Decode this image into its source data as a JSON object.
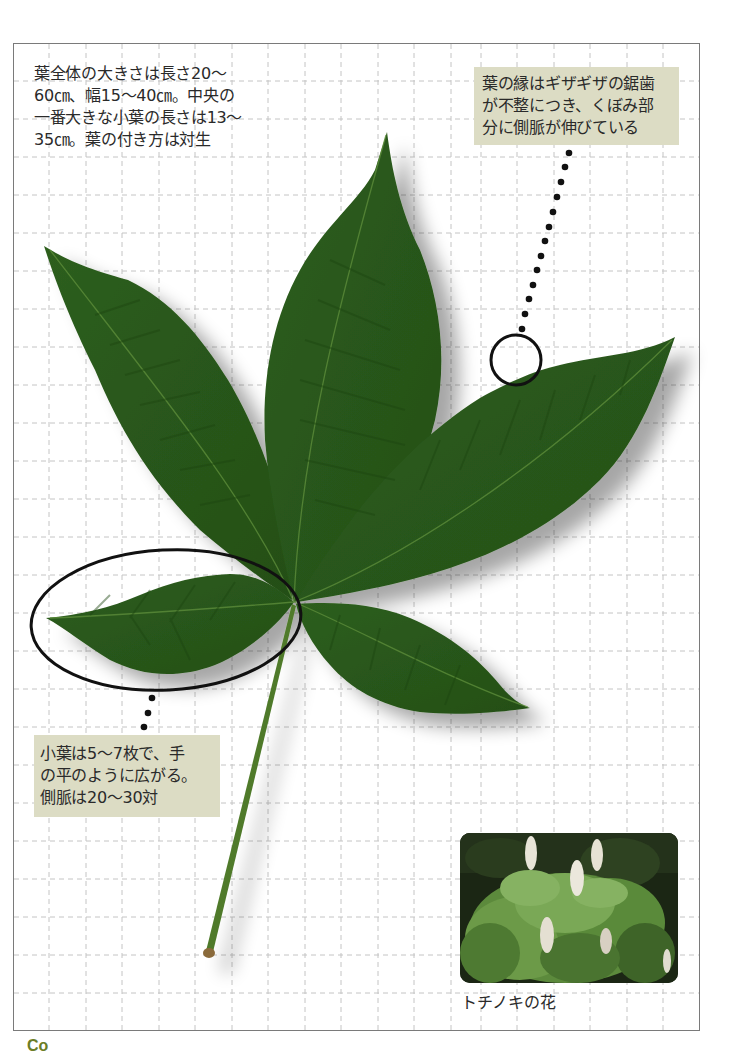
{
  "notes": {
    "overall_size": "葉全体の大きさは長さ20～\n60㎝、幅15～40㎝。中央の\n一番大きな小葉の長さは13～\n35㎝。葉の付き方は対生",
    "leaf_margin": "葉の縁はギザギザの鋸歯\nが不整につき、くぼみ部\n分に側脈が伸びている",
    "leaflets": "小葉は5～7枚で、手\nの平のように広がる。\n側脈は20～30対"
  },
  "photo": {
    "caption": "トチノキの花",
    "alt": "トチノキの花の写真"
  },
  "footer": {
    "corner_mark": "Co"
  },
  "colors": {
    "leaf": "#2f5f1e",
    "leaf_dark": "#224a15",
    "vein": "#5a8a3a",
    "callout_bg": "#dcdcc4",
    "grid": "#bdbdbd",
    "frame": "#7a7a7a",
    "accent": "#6b7d25"
  }
}
